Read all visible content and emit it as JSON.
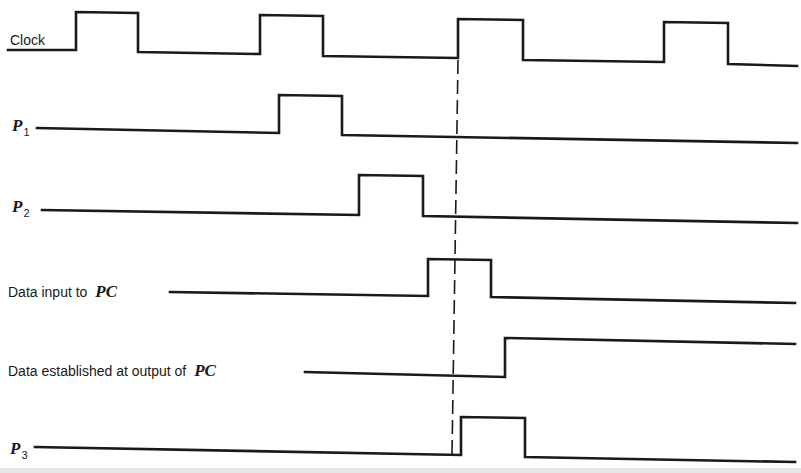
{
  "diagram": {
    "type": "timing-diagram",
    "colors": {
      "ink": "#1a1a1a",
      "background": "#ffffff"
    },
    "signals": [
      {
        "id": "clock",
        "label": "Clock",
        "label_symbol": "",
        "label_subscript": "",
        "label_pos": {
          "x": 10,
          "y": 33
        },
        "path": "M8,50 L76,50 L76,12 L138,13 L138,52 L260,54 L260,15 L323,16 L323,56 L458,58 L458,19 L523,20 L523,60 L664,62 L664,22 L728,23 L728,64 L797,66",
        "pulses": [
          {
            "rise_x": 76,
            "fall_x": 138
          },
          {
            "rise_x": 260,
            "fall_x": 323
          },
          {
            "rise_x": 458,
            "fall_x": 523
          },
          {
            "rise_x": 664,
            "fall_x": 728
          }
        ]
      },
      {
        "id": "p1",
        "label": "",
        "label_symbol": "P",
        "label_subscript": "1",
        "label_pos": {
          "x": 12,
          "y": 117
        },
        "path": "M37,128 L279,133 L279,95 L342,96 L342,135 L797,143",
        "pulses": [
          {
            "rise_x": 279,
            "fall_x": 342
          }
        ]
      },
      {
        "id": "p2",
        "label": "",
        "label_symbol": "P",
        "label_subscript": "2",
        "label_pos": {
          "x": 12,
          "y": 198
        },
        "path": "M42,210 L359,215 L359,175 L423,176 L423,216 L797,223",
        "pulses": [
          {
            "rise_x": 359,
            "fall_x": 423
          }
        ]
      },
      {
        "id": "data-input-pc",
        "label": "Data input to ",
        "label_symbol": "PC",
        "label_subscript": "",
        "label_pos": {
          "x": 8,
          "y": 281
        },
        "path": "M170,292 L428,296 L428,259 L491,260 L491,297 L795,303",
        "pulses": [
          {
            "rise_x": 428,
            "fall_x": 491
          }
        ]
      },
      {
        "id": "data-established-pc",
        "label": "Data established at output of ",
        "label_symbol": "PC",
        "label_subscript": "",
        "label_pos": {
          "x": 8,
          "y": 361
        },
        "path": "M305,372 L505,377 L505,338 L795,344",
        "pulses": [
          {
            "rise_x": 505,
            "fall_x": null
          }
        ]
      },
      {
        "id": "p3",
        "label": "",
        "label_symbol": "P",
        "label_subscript": "3",
        "label_pos": {
          "x": 10,
          "y": 440
        },
        "path": "M35,447 L461,455 L461,417 L525,418 L525,457 L795,462",
        "pulses": [
          {
            "rise_x": 461,
            "fall_x": 525
          }
        ]
      }
    ],
    "reference_line": {
      "id": "clock-edge-reference",
      "style": "dashed",
      "x1": 458,
      "y1": 60,
      "x2": 452,
      "y2": 455
    }
  }
}
